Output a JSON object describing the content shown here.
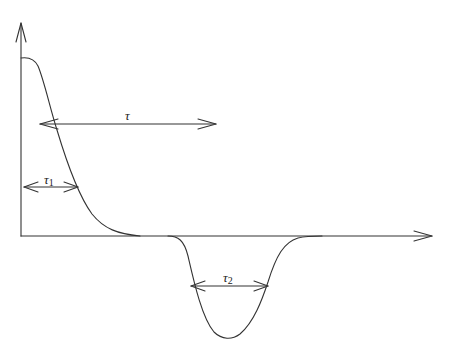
{
  "diagram": {
    "title": "",
    "axes": {
      "y_axis": {
        "label": "",
        "arrow": true
      },
      "x_axis": {
        "label": "",
        "arrow": true
      }
    },
    "curves": [
      {
        "name": "positive-decay",
        "description": "High plateau near origin, smooth decay to zero"
      },
      {
        "name": "negative-dip",
        "description": "Gaussian-like negative dip below baseline"
      }
    ],
    "annotations": {
      "tau": {
        "symbol": "τ",
        "subscript": ""
      },
      "tau1": {
        "symbol": "τ",
        "subscript": "1"
      },
      "tau2": {
        "symbol": "τ",
        "subscript": "2"
      }
    },
    "colors": {
      "line": "#333333",
      "background": "#ffffff"
    }
  }
}
